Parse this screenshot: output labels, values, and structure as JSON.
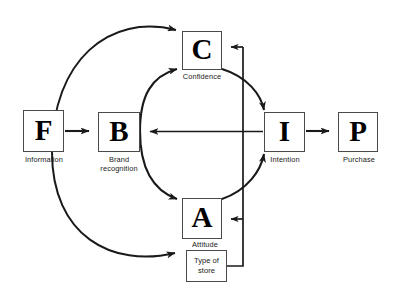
{
  "diagram": {
    "nodes": [
      {
        "id": "F",
        "letter": "F",
        "caption": "Information"
      },
      {
        "id": "B",
        "letter": "B",
        "caption": "Brand\nrecognition"
      },
      {
        "id": "C",
        "letter": "C",
        "caption": "Confidence"
      },
      {
        "id": "A",
        "letter": "A",
        "caption": "Attitude"
      },
      {
        "id": "I",
        "letter": "I",
        "caption": "Intention"
      },
      {
        "id": "P",
        "letter": "P",
        "caption": "Purchase"
      }
    ],
    "aux_boxes": [
      {
        "id": "store",
        "label": "Type of\nstore"
      }
    ],
    "edges": [
      {
        "from": "F",
        "to": "B",
        "style": "straight"
      },
      {
        "from": "F",
        "to": "C",
        "style": "curved"
      },
      {
        "from": "F",
        "to": "A",
        "style": "curved"
      },
      {
        "from": "B",
        "to": "C",
        "style": "curved"
      },
      {
        "from": "B",
        "to": "A",
        "style": "curved"
      },
      {
        "from": "C",
        "to": "I",
        "style": "curved"
      },
      {
        "from": "A",
        "to": "I",
        "style": "curved"
      },
      {
        "from": "I",
        "to": "B",
        "style": "straight"
      },
      {
        "from": "I",
        "to": "P",
        "style": "straight"
      },
      {
        "from": "store",
        "to": "C",
        "style": "orthogonal"
      },
      {
        "from": "store",
        "to": "A",
        "style": "orthogonal"
      }
    ],
    "colors": {
      "stroke": "#1a1a1a",
      "box_border": "#4a4a4a",
      "background": "#ffffff",
      "text": "#000000"
    }
  }
}
